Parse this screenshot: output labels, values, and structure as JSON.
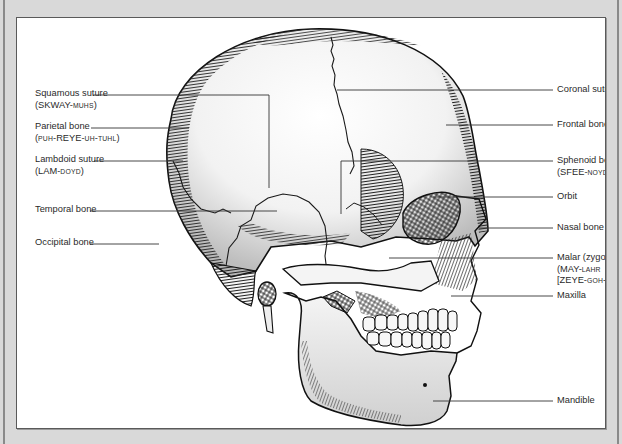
{
  "figure": {
    "type": "anatomical-diagram",
    "colors": {
      "background": "#d9d9d9",
      "panel": "#ffffff",
      "ink": "#222222",
      "border": "#5a5a5a"
    }
  },
  "labels_left": [
    {
      "id": "squamous-suture",
      "name": "Squamous suture",
      "pron": [
        {
          "t": "(SKWAY-"
        },
        {
          "t": "MUHS",
          "sc": true
        },
        {
          "t": ")"
        }
      ]
    },
    {
      "id": "parietal-bone",
      "name": "Parietal bone",
      "pron": [
        {
          "t": "(",
          "sc": false
        },
        {
          "t": "PUH",
          "sc": true
        },
        {
          "t": "-REYE-"
        },
        {
          "t": "UH",
          "sc": true
        },
        {
          "t": "-"
        },
        {
          "t": "TUHL",
          "sc": true
        },
        {
          "t": ")"
        }
      ]
    },
    {
      "id": "lambdoid-suture",
      "name": "Lambdoid suture",
      "pron": [
        {
          "t": "(LAM-"
        },
        {
          "t": "DOYD",
          "sc": true
        },
        {
          "t": ")"
        }
      ]
    },
    {
      "id": "temporal-bone",
      "name": "Temporal bone"
    },
    {
      "id": "occipital-bone",
      "name": "Occipital bone"
    }
  ],
  "labels_right": [
    {
      "id": "coronal-suture",
      "name": "Coronal suture"
    },
    {
      "id": "frontal-bone",
      "name": "Frontal bone"
    },
    {
      "id": "sphenoid-bone",
      "name": "Sphenoid bone",
      "pron": [
        {
          "t": "(SFEE-"
        },
        {
          "t": "NOYD",
          "sc": true
        },
        {
          "t": ")"
        }
      ]
    },
    {
      "id": "orbit",
      "name": "Orbit"
    },
    {
      "id": "nasal-bone",
      "name": "Nasal bone"
    },
    {
      "id": "malar-bone",
      "name": "Malar (zygomatic) bone",
      "pron": [
        {
          "t": "(MAY-"
        },
        {
          "t": "LAHR",
          "sc": true
        }
      ],
      "pron2": [
        {
          "t": "[ZEYE-"
        },
        {
          "t": "GOH",
          "sc": true
        },
        {
          "t": "-MAT-"
        },
        {
          "t": "IK",
          "sc": true
        },
        {
          "t": "])"
        }
      ]
    },
    {
      "id": "maxilla",
      "name": "Maxilla"
    },
    {
      "id": "mandible",
      "name": "Mandible"
    }
  ]
}
